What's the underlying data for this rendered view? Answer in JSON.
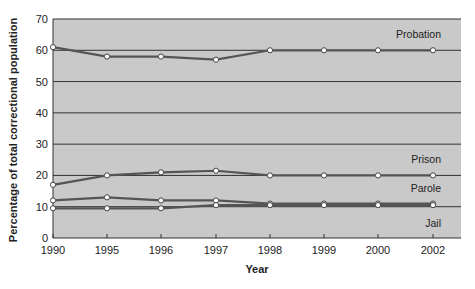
{
  "chart_data": {
    "type": "line",
    "title": "",
    "xlabel": "Year",
    "ylabel": "Percentage of total correctional population",
    "ylim": [
      0,
      70
    ],
    "yticks": [
      0,
      10,
      20,
      30,
      40,
      50,
      60,
      70
    ],
    "grid": true,
    "categories": [
      "1990",
      "1995",
      "1996",
      "1997",
      "1998",
      "1999",
      "2000",
      "2002"
    ],
    "series": [
      {
        "name": "Probation",
        "values": [
          61,
          58,
          58,
          57,
          60,
          60,
          60,
          60
        ]
      },
      {
        "name": "Prison",
        "values": [
          17,
          20,
          21,
          21.5,
          20,
          20,
          20,
          20
        ]
      },
      {
        "name": "Parole",
        "values": [
          12,
          13,
          12,
          12,
          11,
          11,
          11,
          11
        ]
      },
      {
        "name": "Jail",
        "values": [
          9.5,
          9.5,
          9.5,
          10.5,
          10.5,
          10.5,
          10.5,
          10.5
        ]
      }
    ],
    "legend_position": "inline labels at right end of lines",
    "colors": {
      "plot_bg": "#c9c9c9",
      "line": "#555555",
      "grid": "#333333",
      "marker_fill": "#ffffff"
    }
  },
  "labels": {
    "y_axis": "Percentage of total correctional population",
    "x_axis": "Year"
  }
}
